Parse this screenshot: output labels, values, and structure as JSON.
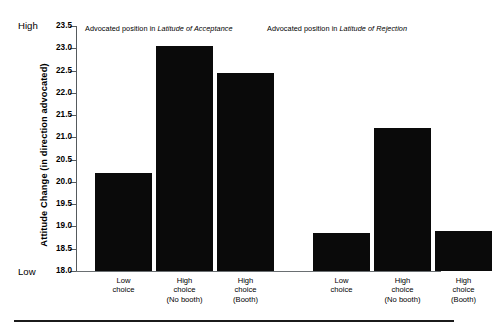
{
  "chart_data": {
    "type": "bar",
    "title": "",
    "subtitle": "",
    "xlabel": "",
    "ylabel": "Attitude Change (in direction advocated)",
    "ylim": [
      18.0,
      23.5
    ],
    "ytick_labels": [
      "23.5",
      "23.0",
      "22.5",
      "22.0",
      "21.5",
      "21.0",
      "20.5",
      "20.0",
      "19.5",
      "19.0",
      "18.5",
      "18.0"
    ],
    "ytick_values": [
      23.5,
      23.0,
      22.5,
      22.0,
      21.5,
      21.0,
      20.5,
      20.0,
      19.5,
      19.0,
      18.5,
      18.0
    ],
    "y_axis_high_anchor": "High",
    "y_axis_low_anchor": "Low",
    "grid": false,
    "legend": "none",
    "bar_color": "#0a0a0a",
    "axis_color": "#555a5d",
    "baseline": 18.0,
    "categories": [
      "Low choice",
      "High choice (No booth)",
      "High choice (Booth)",
      "Low choice",
      "High choice (No booth)",
      "High choice (Booth)"
    ],
    "values": [
      20.2,
      23.05,
      22.45,
      18.85,
      21.2,
      18.9
    ],
    "groups": [
      {
        "header_prefix": "Advocated position in ",
        "header_emphasis": "Latitude of Acceptance",
        "categories": [
          "Low choice",
          "High choice (No booth)",
          "High choice (Booth)"
        ],
        "values": [
          20.2,
          23.05,
          22.45
        ]
      },
      {
        "header_prefix": "Advocated position in ",
        "header_emphasis": "Latitude of Rejection",
        "categories": [
          "Low choice",
          "High choice (No booth)",
          "High choice (Booth)"
        ],
        "values": [
          18.85,
          21.2,
          18.9
        ]
      }
    ]
  },
  "axis": {
    "ticks": [
      {
        "label": "23.5",
        "value": 23.5
      },
      {
        "label": "23.0",
        "value": 23.0
      },
      {
        "label": "22.5",
        "value": 22.5
      },
      {
        "label": "22.0",
        "value": 22.0
      },
      {
        "label": "21.5",
        "value": 21.5
      },
      {
        "label": "21.0",
        "value": 21.0
      },
      {
        "label": "20.5",
        "value": 20.5
      },
      {
        "label": "20.0",
        "value": 20.0
      },
      {
        "label": "19.5",
        "value": 19.5
      },
      {
        "label": "19.0",
        "value": 19.0
      },
      {
        "label": "18.5",
        "value": 18.5
      },
      {
        "label": "18.0",
        "value": 18.0
      }
    ],
    "title": "Attitude Change (in direction advocated)",
    "high_anchor": "High",
    "low_anchor": "Low"
  },
  "headers": {
    "acceptance_prefix": "Advocated position in ",
    "acceptance_emphasis": "Latitude of Acceptance",
    "rejection_prefix": "Advocated position in ",
    "rejection_emphasis": "Latitude of Rejection"
  },
  "x_labels": [
    {
      "line1": "Low",
      "line2": "choice",
      "line3": ""
    },
    {
      "line1": "High",
      "line2": "choice",
      "line3": "(No booth)"
    },
    {
      "line1": "High",
      "line2": "choice",
      "line3": "(Booth)"
    },
    {
      "line1": "Low",
      "line2": "choice",
      "line3": ""
    },
    {
      "line1": "High",
      "line2": "choice",
      "line3": "(No booth)"
    },
    {
      "line1": "High",
      "line2": "choice",
      "line3": "(Booth)"
    }
  ]
}
